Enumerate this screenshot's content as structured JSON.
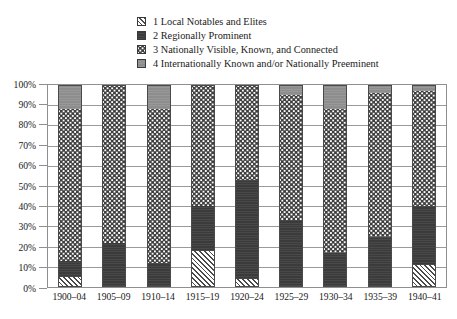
{
  "chart_data": {
    "type": "bar",
    "subtype": "stacked-bar-100-percent",
    "title": "",
    "xlabel": "",
    "ylabel": "",
    "ylim": [
      0,
      100
    ],
    "y_tick_labels": [
      "100%",
      "90%",
      "80%",
      "70%",
      "60%",
      "50%",
      "40%",
      "30%",
      "20%",
      "10%",
      "0%"
    ],
    "y_tick_values": [
      100,
      90,
      80,
      70,
      60,
      50,
      40,
      30,
      20,
      10,
      0
    ],
    "grid": true,
    "legend_position": "top-center",
    "categories": [
      "1900–04",
      "1905–09",
      "1910–14",
      "1915–19",
      "1920–24",
      "1925–29",
      "1930–34",
      "1935–39",
      "1940–41"
    ],
    "series": [
      {
        "name": "1 Local Notables and Elites",
        "key": "local",
        "pattern": "diagonal-hatch",
        "color": "#ffffff",
        "values": [
          5,
          0,
          0,
          18,
          4,
          0,
          0,
          0,
          11
        ]
      },
      {
        "name": "2 Regionally Prominent",
        "key": "regional",
        "pattern": "solid-dark",
        "color": "#3b3b3b",
        "values": [
          8,
          22,
          12,
          22,
          49,
          33,
          17,
          25,
          29
        ]
      },
      {
        "name": "3 Nationally Visible, Known, and Connected",
        "key": "national",
        "pattern": "dotted",
        "color": "#ffffff",
        "values": [
          75,
          78,
          76,
          60,
          47,
          62,
          71,
          71,
          57
        ]
      },
      {
        "name": "4 Internationally Known and/or Nationally Preeminent",
        "key": "international",
        "pattern": "solid-gray",
        "color": "#8d8d8d",
        "values": [
          12,
          0,
          12,
          0,
          0,
          5,
          12,
          4,
          3
        ]
      }
    ]
  },
  "legend": {
    "items": [
      {
        "label": "1 Local Notables and Elites",
        "swatch": "diagonal-hatch"
      },
      {
        "label": "2 Regionally Prominent",
        "swatch": "solid-dark"
      },
      {
        "label": "3 Nationally Visible, Known, and Connected",
        "swatch": "dotted"
      },
      {
        "label": "4 Internationally Known and/or Nationally Preeminent",
        "swatch": "solid-gray"
      }
    ]
  }
}
